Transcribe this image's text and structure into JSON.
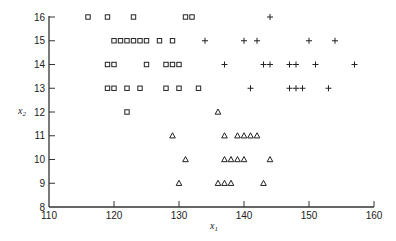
{
  "chart_data": {
    "type": "scatter",
    "title": "",
    "xlabel": "x1",
    "ylabel": "x2",
    "xlim": [
      110,
      160
    ],
    "ylim": [
      8,
      16
    ],
    "xticks": [
      110,
      120,
      130,
      140,
      150,
      160
    ],
    "yticks": [
      8,
      9,
      10,
      11,
      12,
      13,
      14,
      15,
      16
    ],
    "grid": false,
    "legend": null,
    "series": [
      {
        "name": "group-square",
        "marker": "square",
        "points": [
          [
            116,
            16
          ],
          [
            119,
            16
          ],
          [
            123,
            16
          ],
          [
            131,
            16
          ],
          [
            132,
            16
          ],
          [
            120,
            15
          ],
          [
            121,
            15
          ],
          [
            122,
            15
          ],
          [
            123,
            15
          ],
          [
            124,
            15
          ],
          [
            125,
            15
          ],
          [
            127,
            15
          ],
          [
            129,
            15
          ],
          [
            119,
            14
          ],
          [
            120,
            14
          ],
          [
            125,
            14
          ],
          [
            128,
            14
          ],
          [
            129,
            14
          ],
          [
            130,
            14
          ],
          [
            119,
            13
          ],
          [
            120,
            13
          ],
          [
            122,
            13
          ],
          [
            124,
            13
          ],
          [
            128,
            13
          ],
          [
            130,
            13
          ],
          [
            133,
            13
          ],
          [
            122,
            12
          ]
        ]
      },
      {
        "name": "group-plus",
        "marker": "plus",
        "points": [
          [
            144,
            16
          ],
          [
            134,
            15
          ],
          [
            140,
            15
          ],
          [
            142,
            15
          ],
          [
            150,
            15
          ],
          [
            154,
            15
          ],
          [
            137,
            14
          ],
          [
            143,
            14
          ],
          [
            144,
            14
          ],
          [
            147,
            14
          ],
          [
            148,
            14
          ],
          [
            151,
            14
          ],
          [
            157,
            14
          ],
          [
            141,
            13
          ],
          [
            147,
            13
          ],
          [
            148,
            13
          ],
          [
            149,
            13
          ],
          [
            153,
            13
          ]
        ]
      },
      {
        "name": "group-triangle",
        "marker": "triangle",
        "points": [
          [
            136,
            12
          ],
          [
            129,
            11
          ],
          [
            137,
            11
          ],
          [
            139,
            11
          ],
          [
            140,
            11
          ],
          [
            141,
            11
          ],
          [
            142,
            11
          ],
          [
            131,
            10
          ],
          [
            137,
            10
          ],
          [
            138,
            10
          ],
          [
            139,
            10
          ],
          [
            140,
            10
          ],
          [
            144,
            10
          ],
          [
            130,
            9
          ],
          [
            136,
            9
          ],
          [
            137,
            9
          ],
          [
            138,
            9
          ],
          [
            143,
            9
          ]
        ]
      }
    ]
  },
  "axes": {
    "x_title_main": "x",
    "x_title_sub": "1",
    "y_title_main": "x",
    "y_title_sub": "2"
  }
}
